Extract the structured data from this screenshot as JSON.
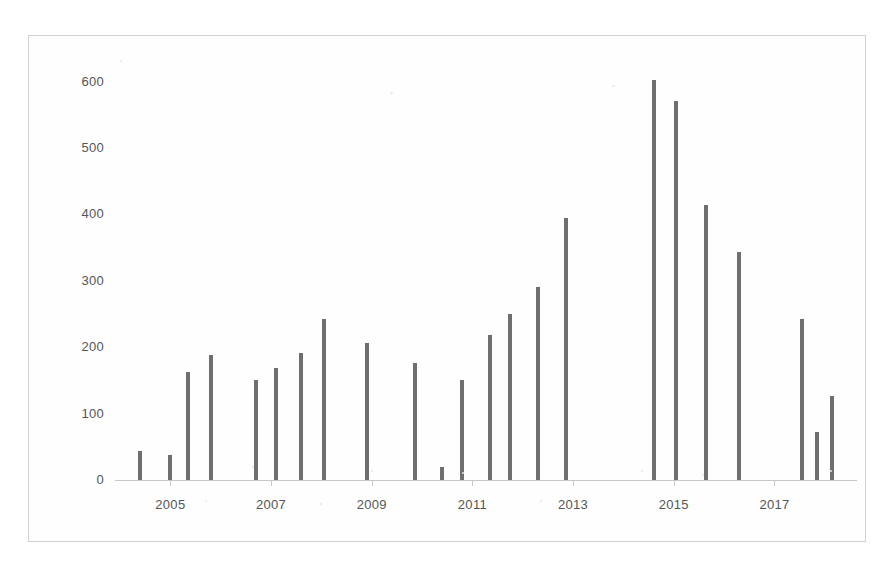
{
  "chart_data": {
    "type": "bar",
    "title": "",
    "subtitle": "",
    "xlabel": "",
    "ylabel": "# operations",
    "ylim": [
      0,
      640
    ],
    "yticks": [
      0,
      100,
      200,
      300,
      400,
      500,
      600
    ],
    "ytick_labels": [
      "0",
      "100",
      "200",
      "300",
      "400",
      "500",
      "600"
    ],
    "xticks": [
      2005,
      2007,
      2009,
      2011,
      2013,
      2015,
      2017
    ],
    "xtick_labels": [
      "2005",
      "2007",
      "2009",
      "2011",
      "2013",
      "2015",
      "2017"
    ],
    "xlim": [
      2003.9,
      2018.6
    ],
    "grid": false,
    "legend": null,
    "bar_color": "#6f6f6f",
    "categories": [
      "2004 Q2",
      "2004 Q4",
      "2005 Q2",
      "2005 Q4",
      "2006 Q4",
      "2007 Q2",
      "2007 Q4",
      "2008 Q2",
      "2008 Q4",
      "2009 Q4",
      "2010 Q2",
      "2010 Q4",
      "2011 Q2",
      "2011 Q4",
      "2012 Q2",
      "2012 Q4",
      "2014 Q3",
      "2015 Q1",
      "2015 Q4",
      "2016 Q4",
      "2017 Q3",
      "2017 Q4",
      "2018 Q1"
    ],
    "x": [
      2004.4,
      2005.0,
      2005.35,
      2005.8,
      2006.7,
      2007.1,
      2007.6,
      2008.05,
      2008.9,
      2009.85,
      2010.4,
      2010.8,
      2011.35,
      2011.75,
      2012.3,
      2012.85,
      2014.6,
      2015.05,
      2015.65,
      2016.3,
      2017.55,
      2017.85,
      2018.15
    ],
    "values": [
      44,
      38,
      162,
      189,
      150,
      168,
      192,
      243,
      207,
      176,
      19,
      151,
      218,
      250,
      291,
      394,
      603,
      570,
      414,
      344,
      243,
      72,
      126
    ],
    "annotations": []
  },
  "axis": {
    "y_title": "# operations"
  }
}
